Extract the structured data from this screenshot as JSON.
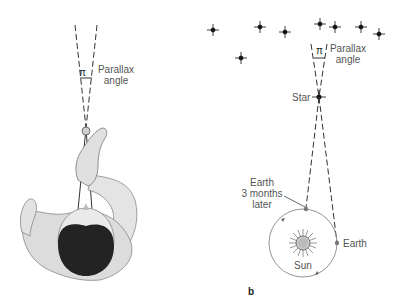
{
  "panel_a": {
    "pi_symbol": "π",
    "angle_label_line1": "Parallax",
    "angle_label_line2": "angle",
    "illustration": "person-holding-finger-at-arms-length-top-view"
  },
  "panel_b": {
    "panel_letter": "b",
    "pi_symbol": "π",
    "angle_label_line1": "Parallax",
    "angle_label_line2": "angle",
    "star_label": "Star",
    "earth_later_line1": "Earth",
    "earth_later_line2": "3 months",
    "earth_later_line3": "later",
    "earth_label": "Earth",
    "sun_label": "Sun",
    "background_stars": 8
  },
  "colors": {
    "line": "#333333",
    "text": "#555555",
    "orbit": "#888888",
    "skin": "#d8d8d8",
    "hair": "#222222"
  }
}
